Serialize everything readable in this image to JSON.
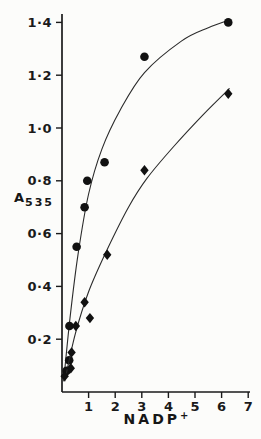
{
  "figure": {
    "background": "#fcfcfa",
    "ink": "#1a1a1a",
    "curve_color": "#2b2b2b",
    "marker_color": "#111111"
  },
  "chart_data": {
    "type": "scatter",
    "title": "",
    "xlabel": {
      "main": "NADP",
      "sup": "+"
    },
    "ylabel": {
      "main": "A",
      "sub": "535"
    },
    "xlim": [
      0,
      7.2
    ],
    "ylim": [
      0,
      1.47
    ],
    "grid": false,
    "legend": "none",
    "x_ticks": [
      {
        "v": 1,
        "label": "1"
      },
      {
        "v": 2,
        "label": "2"
      },
      {
        "v": 3,
        "label": "3"
      },
      {
        "v": 4,
        "label": "4"
      },
      {
        "v": 5,
        "label": "5"
      },
      {
        "v": 6,
        "label": "6"
      },
      {
        "v": 7,
        "label": "7"
      }
    ],
    "y_ticks": [
      {
        "v": 0.2,
        "label": "0·2"
      },
      {
        "v": 0.4,
        "label": "0·4"
      },
      {
        "v": 0.6,
        "label": "0·6"
      },
      {
        "v": 0.8,
        "label": "0·8"
      },
      {
        "v": 1.0,
        "label": "1·0"
      },
      {
        "v": 1.2,
        "label": "1·2"
      },
      {
        "v": 1.4,
        "label": "1·4"
      }
    ],
    "series": [
      {
        "name": "filled-circle-series",
        "marker": "circle",
        "points": [
          [
            0.17,
            0.08
          ],
          [
            0.27,
            0.12
          ],
          [
            0.28,
            0.25
          ],
          [
            0.55,
            0.55
          ],
          [
            0.85,
            0.7
          ],
          [
            0.95,
            0.8
          ],
          [
            1.6,
            0.87
          ],
          [
            3.1,
            1.27
          ],
          [
            6.25,
            1.4
          ]
        ],
        "curve": [
          [
            0.06,
            0.04
          ],
          [
            0.3,
            0.28
          ],
          [
            0.6,
            0.52
          ],
          [
            1.0,
            0.75
          ],
          [
            1.5,
            0.92
          ],
          [
            2.2,
            1.07
          ],
          [
            3.1,
            1.21
          ],
          [
            4.5,
            1.33
          ],
          [
            5.5,
            1.38
          ],
          [
            6.3,
            1.41
          ]
        ]
      },
      {
        "name": "filled-diamond-series",
        "marker": "diamond",
        "points": [
          [
            0.1,
            0.06
          ],
          [
            0.33,
            0.09
          ],
          [
            0.36,
            0.15
          ],
          [
            0.52,
            0.25
          ],
          [
            0.85,
            0.34
          ],
          [
            1.05,
            0.28
          ],
          [
            1.7,
            0.52
          ],
          [
            3.1,
            0.84
          ],
          [
            6.25,
            1.13
          ]
        ],
        "curve": [
          [
            0.1,
            0.04
          ],
          [
            0.5,
            0.22
          ],
          [
            1.0,
            0.38
          ],
          [
            1.7,
            0.54
          ],
          [
            2.5,
            0.7
          ],
          [
            3.2,
            0.81
          ],
          [
            4.2,
            0.93
          ],
          [
            5.3,
            1.05
          ],
          [
            6.3,
            1.15
          ]
        ]
      }
    ]
  }
}
